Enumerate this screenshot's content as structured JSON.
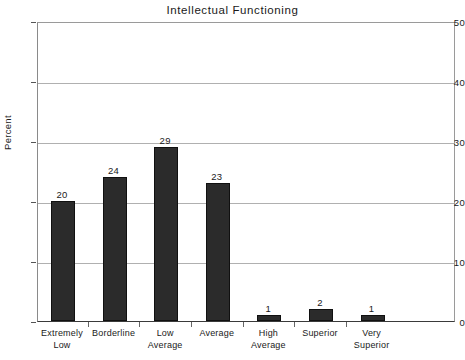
{
  "chart_data": {
    "type": "bar",
    "title": "Intellectual Functioning",
    "xlabel": "",
    "ylabel": "Percent",
    "categories": [
      "Extremely Low",
      "Borderline",
      "Low Average",
      "Average",
      "High Average",
      "Superior",
      "Very Superior"
    ],
    "category_lines": [
      [
        "Extremely",
        "Low"
      ],
      [
        "Borderline",
        ""
      ],
      [
        "Low",
        "Average"
      ],
      [
        "Average",
        ""
      ],
      [
        "High",
        "Average"
      ],
      [
        "Superior",
        ""
      ],
      [
        "Very",
        "Superior"
      ]
    ],
    "values": [
      20,
      24,
      29,
      23,
      1,
      2,
      1
    ],
    "value_labels": [
      "20",
      "24",
      "29",
      "23",
      "1",
      "2",
      "1"
    ],
    "ylim": [
      0,
      50
    ],
    "yticks": [
      0,
      10,
      20,
      30,
      40,
      50
    ],
    "ytick_labels": [
      "0",
      "10",
      "20",
      "30",
      "40",
      "50"
    ],
    "grid": true,
    "legend": false,
    "bar_color": "#2b2b2b",
    "background_color": "#ffffff",
    "gridline_color": "#b0b0b0",
    "axis_color": "#3a3a3a",
    "text_color": "#1a1a1a"
  }
}
